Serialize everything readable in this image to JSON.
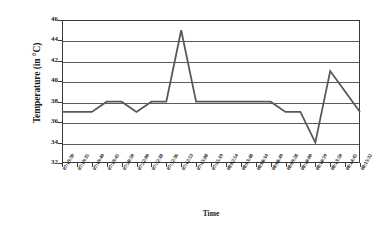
{
  "chart_data": {
    "type": "line",
    "title": "",
    "xlabel": "Time",
    "ylabel": "Temperature (in °C)",
    "ylim": [
      32,
      46
    ],
    "yticks": [
      32,
      34,
      36,
      38,
      40,
      42,
      44,
      46
    ],
    "grid": true,
    "legend": "none",
    "series_color": "#595959",
    "categories": [
      "07:19:30",
      "07:19:35",
      "07:19:40",
      "07:19:45",
      "07:20:50",
      "07:22:00",
      "07:32:18",
      "07:32:36",
      "07:42:53",
      "07:45:08",
      "07:45:19",
      "08:02:54",
      "08:03:48",
      "08:06:14",
      "08:06:49",
      "08:09:28",
      "08:10:00",
      "08:10:59",
      "08:13:50",
      "08:14:45",
      "08:15:32"
    ],
    "values": [
      37,
      37,
      37,
      38,
      38,
      37,
      38,
      38,
      45,
      38,
      38,
      38,
      38,
      38,
      38,
      37,
      37,
      34,
      41,
      39,
      37
    ],
    "series": [
      {
        "name": "Temperature",
        "values": [
          37,
          37,
          37,
          38,
          38,
          37,
          38,
          38,
          45,
          38,
          38,
          38,
          38,
          38,
          38,
          37,
          37,
          34,
          41,
          39,
          37
        ]
      }
    ]
  }
}
